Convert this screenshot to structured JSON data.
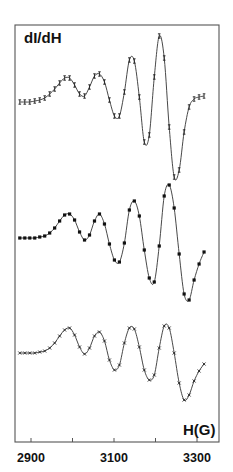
{
  "chart_data": {
    "type": "line",
    "title": "",
    "ylabel": "dI/dH",
    "xlabel": "H(G)",
    "xlim": [
      2870,
      3325
    ],
    "xticks": [
      2900,
      3000,
      3100,
      3200,
      3300
    ],
    "xtick_labels": [
      "2900",
      "",
      "3100",
      "",
      "3300"
    ],
    "grid": false,
    "legend": null,
    "y_units": "arbitrary (derivative EPR signal, vertically offset)",
    "series": [
      {
        "name": "top spectrum",
        "marker": "tick (|)",
        "offset": 0,
        "x": [
          2873,
          2885,
          2897,
          2909,
          2921,
          2933,
          2945,
          2957,
          2969,
          2981,
          2993,
          3005,
          3017,
          3029,
          3041,
          3053,
          3065,
          3077,
          3089,
          3101,
          3113,
          3125,
          3137,
          3149,
          3161,
          3173,
          3185,
          3197,
          3209,
          3221,
          3233,
          3245,
          3257,
          3269,
          3281,
          3293,
          3305,
          3317
        ],
        "y": [
          0,
          0,
          0,
          1,
          2,
          4,
          8,
          13,
          19,
          24,
          24,
          17,
          8,
          6,
          15,
          26,
          28,
          20,
          2,
          -14,
          -14,
          10,
          42,
          41,
          5,
          -40,
          -33,
          25,
          66,
          44,
          -25,
          -75,
          -68,
          -30,
          -5,
          3,
          5,
          6
        ]
      },
      {
        "name": "middle spectrum",
        "marker": "filled circle",
        "offset": -136,
        "x": [
          2873,
          2885,
          2897,
          2909,
          2921,
          2933,
          2945,
          2957,
          2969,
          2981,
          2993,
          3005,
          3017,
          3029,
          3041,
          3053,
          3065,
          3077,
          3089,
          3101,
          3113,
          3125,
          3137,
          3149,
          3161,
          3173,
          3185,
          3197,
          3209,
          3221,
          3233,
          3245,
          3257,
          3269,
          3281,
          3293,
          3305,
          3317
        ],
        "y": [
          0,
          0,
          0,
          0,
          1,
          2,
          5,
          10,
          17,
          23,
          24,
          18,
          6,
          -2,
          3,
          17,
          24,
          14,
          -6,
          -22,
          -24,
          -5,
          28,
          37,
          22,
          -12,
          -40,
          -44,
          -8,
          42,
          53,
          30,
          -16,
          -56,
          -62,
          -42,
          -26,
          -14
        ]
      },
      {
        "name": "bottom spectrum",
        "marker": "cross (x)",
        "offset": -251,
        "x": [
          2873,
          2885,
          2897,
          2909,
          2921,
          2933,
          2945,
          2957,
          2969,
          2981,
          2993,
          3005,
          3017,
          3029,
          3041,
          3053,
          3065,
          3077,
          3089,
          3101,
          3113,
          3125,
          3137,
          3149,
          3161,
          3173,
          3185,
          3197,
          3209,
          3221,
          3233,
          3245,
          3257,
          3269,
          3281,
          3293,
          3305,
          3317
        ],
        "y": [
          0,
          0,
          0,
          0,
          1,
          2,
          5,
          10,
          17,
          23,
          25,
          18,
          6,
          -1,
          5,
          17,
          21,
          12,
          -7,
          -17,
          -12,
          10,
          25,
          24,
          6,
          -17,
          -27,
          -22,
          5,
          27,
          25,
          0,
          -30,
          -47,
          -42,
          -28,
          -18,
          -11
        ]
      }
    ]
  },
  "axes": {
    "y_label": "dI/dH",
    "x_unit_label": "H(G)",
    "tick_labels": [
      "2900",
      "3100",
      "3300"
    ]
  }
}
